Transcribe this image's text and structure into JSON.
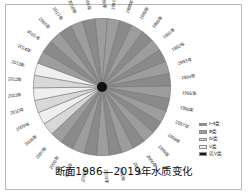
{
  "figure": {
    "title": "断面1986—2019年水质变化"
  },
  "legend": {
    "items": [
      {
        "label": "Ⅰ~Ⅱ类",
        "color": "#8f8f8f"
      },
      {
        "label": "Ⅲ类",
        "color": "#9d9d9d"
      },
      {
        "label": "Ⅳ类",
        "color": "#d8d8d8"
      },
      {
        "label": "Ⅴ类",
        "color": "#efefef"
      },
      {
        "label": "劣Ⅴ类",
        "color": "#1a1a1a"
      }
    ]
  },
  "chart_data": {
    "type": "pie",
    "title": "断面1986—2019年水质变化",
    "xlabel": "",
    "ylabel": "",
    "legend_position": "right",
    "grid": false,
    "hub_color": "#111111",
    "note": "34 equal-angle slices, one per year 1986-2019; slice shade encodes the water-quality class",
    "categories": [
      "1986年",
      "1987年",
      "1988年",
      "1989年",
      "1990年",
      "1991年",
      "1992年",
      "1993年",
      "1994年",
      "1995年",
      "1996年",
      "1997年",
      "1998年",
      "1999年",
      "2000年",
      "2001年",
      "2002年",
      "2003年",
      "2004年",
      "2005年",
      "2006年",
      "2007年",
      "2008年",
      "2009年",
      "2010年",
      "2011年",
      "2012年",
      "2013年",
      "2014年",
      "2015年",
      "2016年",
      "2017年",
      "2018年",
      "2019年"
    ],
    "values": [
      1,
      1,
      1,
      1,
      1,
      1,
      1,
      1,
      1,
      1,
      1,
      1,
      1,
      1,
      1,
      1,
      1,
      1,
      1,
      1,
      1,
      1,
      1,
      1,
      1,
      1,
      1,
      1,
      1,
      1,
      1,
      1,
      1,
      1
    ],
    "slice_classes": [
      "Ⅲ类",
      "Ⅲ类",
      "Ⅰ~Ⅱ类",
      "Ⅲ类",
      "Ⅰ~Ⅱ类",
      "Ⅲ类",
      "Ⅰ~Ⅱ类",
      "Ⅲ类",
      "Ⅰ~Ⅱ类",
      "Ⅲ类",
      "Ⅰ~Ⅱ类",
      "Ⅲ类",
      "Ⅰ~Ⅱ类",
      "Ⅲ类",
      "Ⅰ~Ⅱ类",
      "Ⅲ类",
      "Ⅰ~Ⅱ类",
      "Ⅲ类",
      "Ⅰ~Ⅱ类",
      "Ⅲ类",
      "Ⅰ~Ⅱ类",
      "Ⅲ类",
      "Ⅳ类",
      "Ⅴ类",
      "Ⅳ类",
      "Ⅴ类",
      "Ⅳ类",
      "Ⅴ类",
      "Ⅲ类",
      "Ⅰ~Ⅱ类",
      "Ⅲ类",
      "Ⅰ~Ⅱ类",
      "Ⅲ类",
      "Ⅰ~Ⅱ类"
    ],
    "slice_colors": [
      "#9d9d9d",
      "#9d9d9d",
      "#8a8a8a",
      "#9d9d9d",
      "#8a8a8a",
      "#9d9d9d",
      "#8a8a8a",
      "#9d9d9d",
      "#8a8a8a",
      "#9d9d9d",
      "#8a8a8a",
      "#9d9d9d",
      "#8a8a8a",
      "#9d9d9d",
      "#8a8a8a",
      "#9d9d9d",
      "#8a8a8a",
      "#9d9d9d",
      "#8a8a8a",
      "#9d9d9d",
      "#8a8a8a",
      "#9d9d9d",
      "#d8d8d8",
      "#efefef",
      "#d8d8d8",
      "#efefef",
      "#d8d8d8",
      "#efefef",
      "#9d9d9d",
      "#8a8a8a",
      "#9d9d9d",
      "#8a8a8a",
      "#9d9d9d",
      "#8a8a8a"
    ]
  }
}
